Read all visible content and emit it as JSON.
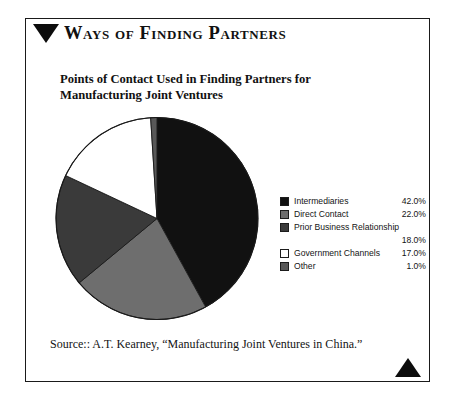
{
  "header": {
    "title": "Ways of Finding Partners",
    "marker_icon": "triangle-down-icon"
  },
  "subtitle": {
    "line1": "Points of Contact Used in Finding Partners for",
    "line2": "Manufacturing Joint Ventures"
  },
  "footer": {
    "source": "Source:: A.T. Kearney, “Manufacturing Joint Ventures in China.”",
    "marker_icon": "triangle-up-icon"
  },
  "legend": {
    "rows": [
      {
        "label": "Intermediaries",
        "value": "42.0%",
        "color": "#111111",
        "show_value_inline": true
      },
      {
        "label": "Direct Contact",
        "value": "22.0%",
        "color": "#6e6e6e",
        "show_value_inline": true
      },
      {
        "label": "Prior Business Relationship",
        "value": "",
        "color": "#3a3a3a",
        "show_value_inline": true
      },
      {
        "label": "",
        "value": "18.0%",
        "color": "",
        "show_value_inline": true
      },
      {
        "label": "Government Channels",
        "value": "17.0%",
        "color": "#ffffff",
        "show_value_inline": true
      },
      {
        "label": "Other",
        "value": "1.0%",
        "color": "#585858",
        "show_value_inline": true
      }
    ]
  },
  "chart_data": {
    "type": "pie",
    "title": "Points of Contact Used in Finding Partners for Manufacturing Joint Ventures",
    "xlabel": "",
    "ylabel": "",
    "legend_position": "right",
    "grid": false,
    "start_angle_deg": 0,
    "direction": "clockwise",
    "units": "percent",
    "categories": [
      "Intermediaries",
      "Direct Contact",
      "Prior Business Relationship",
      "Government Channels",
      "Other"
    ],
    "values": [
      42.0,
      22.0,
      18.0,
      17.0,
      1.0
    ],
    "labels": [
      "42.0%",
      "22.0%",
      "18.0%",
      "17.0%",
      "1.0%"
    ],
    "colors": [
      "#111111",
      "#6e6e6e",
      "#3a3a3a",
      "#ffffff",
      "#585858"
    ],
    "slice_order_clockwise_from_top": [
      {
        "name": "Intermediaries",
        "value": 42.0,
        "color": "#111111"
      },
      {
        "name": "Direct Contact",
        "value": 22.0,
        "color": "#6e6e6e"
      },
      {
        "name": "Prior Business Relationship",
        "value": 18.0,
        "color": "#3a3a3a"
      },
      {
        "name": "Government Channels",
        "value": 17.0,
        "color": "#ffffff"
      },
      {
        "name": "Other",
        "value": 1.0,
        "color": "#585858"
      }
    ],
    "total": 100.0,
    "source": "Source:: A.T. Kearney, “Manufacturing Joint Ventures in China.”"
  },
  "style": {
    "stroke": "#1a1a1a",
    "background": "#ffffff"
  }
}
